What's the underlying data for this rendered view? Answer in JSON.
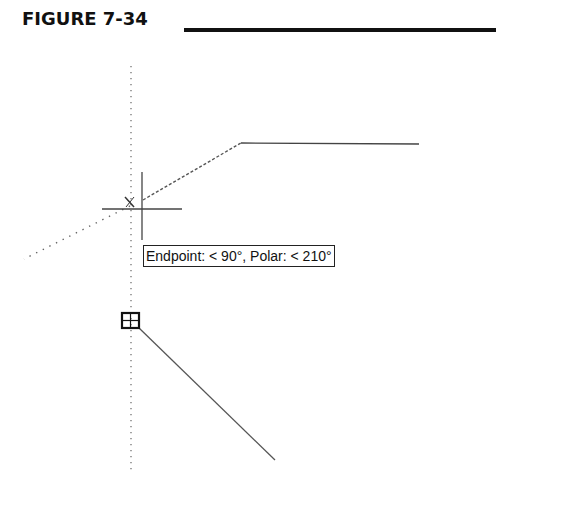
{
  "figure": {
    "title": "FIGURE 7-34"
  },
  "tooltip": {
    "text": "Endpoint: < 90°,  Polar: < 210°"
  },
  "drawing": {
    "colors": {
      "ink": "#111111",
      "line": "#555555",
      "tracking": "#666666"
    },
    "elements": [
      "vertical-tracking-line",
      "polar-tracking-line-210",
      "dashed-rubberband-line",
      "horizontal-line-segment",
      "diagonal-line-segment",
      "crosshair-cursor",
      "endpoint-snap-marker",
      "acquired-point-marker"
    ]
  }
}
